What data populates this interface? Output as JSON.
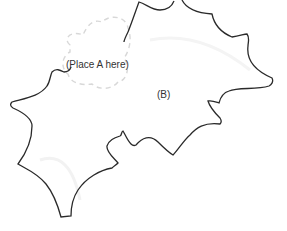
{
  "diagram": {
    "labels": {
      "placeholder_a": "(Place A here)",
      "piece_b": "(B)"
    },
    "colors": {
      "outline": "#2a2a2a",
      "dashed_outline": "#d8d8d8",
      "background": "#ffffff"
    },
    "pieces": [
      {
        "id": "A",
        "state": "empty placeholder (dashed outline)"
      },
      {
        "id": "B",
        "state": "placed piece (solid outline)"
      }
    ]
  }
}
